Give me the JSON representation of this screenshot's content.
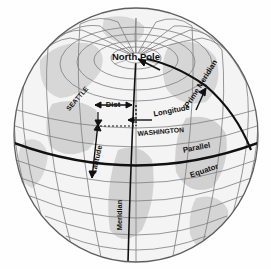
{
  "figure": {
    "background_color": "#ffffff",
    "globe": {
      "fill_color": "#f2f2f2",
      "land_shade_color": "#cfcfcf",
      "outline_color": "#6b6b6b",
      "grid_color": "#7a7a7a",
      "bold_line_color": "#141414",
      "center_x": 136,
      "center_y": 135,
      "radius_x": 122,
      "radius_y": 127
    },
    "labels": {
      "north_pole": "North Pole",
      "prime_meridian": "Prime Meridian",
      "longitude": "Longitude",
      "latitude": "Latitude",
      "parallel": "Parallel",
      "equator": "Equator",
      "meridian": "Meridian",
      "seattle": "SEATTLE",
      "washington": "WASHINGTON",
      "distance": "Dist"
    },
    "annotations": [
      {
        "name": "north-pole",
        "text": "North Pole",
        "x": 136,
        "y": 57,
        "rotation": 0
      },
      {
        "name": "prime-meridian",
        "text": "Prime Meridian",
        "x": 203,
        "y": 85,
        "rotation": -58
      },
      {
        "name": "longitude",
        "text": "Longitude",
        "x": 170,
        "y": 112,
        "rotation": -12
      },
      {
        "name": "latitude",
        "text": "Latitude",
        "x": 98,
        "y": 160,
        "rotation": -78
      },
      {
        "name": "parallel",
        "text": "Parallel",
        "x": 196,
        "y": 150,
        "rotation": -10
      },
      {
        "name": "equator",
        "text": "Equator",
        "x": 203,
        "y": 172,
        "rotation": -18
      },
      {
        "name": "meridian",
        "text": "Meridian",
        "x": 122,
        "y": 215,
        "rotation": -90
      },
      {
        "name": "seattle",
        "text": "SEATTLE",
        "x": 78,
        "y": 100,
        "rotation": -50
      },
      {
        "name": "washington",
        "text": "WASHINGTON",
        "x": 158,
        "y": 133,
        "rotation": -6
      },
      {
        "name": "distance",
        "text": "Dist",
        "x": 110,
        "y": 105,
        "rotation": 0
      }
    ]
  }
}
